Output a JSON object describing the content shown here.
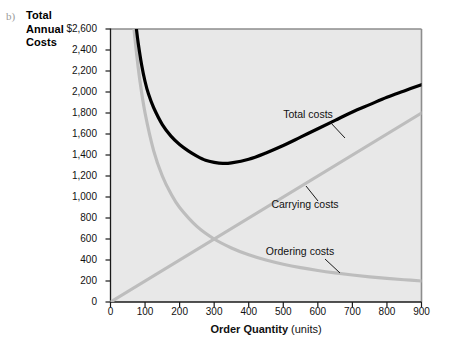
{
  "figure": {
    "part_label": "b)",
    "y_axis_title_lines": [
      "Total",
      "Annual",
      "Costs"
    ],
    "x_axis_title_strong": "Order Quantity",
    "x_axis_title_rest": " (units)"
  },
  "chart_data": {
    "type": "line",
    "title": "",
    "xlabel": "Order Quantity (units)",
    "ylabel": "Total Annual Costs",
    "xlim": [
      0,
      900
    ],
    "ylim": [
      0,
      2600
    ],
    "xticks": [
      0,
      100,
      200,
      300,
      400,
      500,
      600,
      700,
      800,
      900
    ],
    "xtick_labels": [
      "0",
      "100",
      "200",
      "300",
      "400",
      "500",
      "600",
      "700",
      "800",
      "900"
    ],
    "yticks": [
      0,
      200,
      400,
      600,
      800,
      1000,
      1200,
      1400,
      1600,
      1800,
      2000,
      2200,
      2400,
      2600
    ],
    "ytick_labels": [
      "0",
      "200",
      "400",
      "600",
      "800",
      "1,000",
      "1,200",
      "1,400",
      "1,600",
      "1,800",
      "2,000",
      "2,200",
      "2,400",
      "$2,600"
    ],
    "grid": false,
    "legend_position": "inline-annotations",
    "plot_background": "#e8e8e8",
    "series": [
      {
        "name": "Total costs",
        "color": "#000000",
        "width": 3.2,
        "annotation": "Total costs",
        "x": [
          75,
          80,
          90,
          100,
          110,
          125,
          150,
          175,
          200,
          225,
          250,
          275,
          300,
          325,
          350,
          400,
          450,
          500,
          550,
          600,
          650,
          700,
          750,
          800,
          850,
          900
        ],
        "y": [
          2600,
          2470,
          2260,
          2100,
          1980,
          1850,
          1690,
          1580,
          1500,
          1440,
          1390,
          1350,
          1330,
          1320,
          1325,
          1360,
          1420,
          1490,
          1570,
          1650,
          1730,
          1810,
          1880,
          1950,
          2010,
          2070
        ]
      },
      {
        "name": "Carrying costs",
        "color": "#bdbdbd",
        "width": 3.2,
        "annotation": "Carrying costs",
        "x": [
          0,
          900
        ],
        "y": [
          0,
          1800
        ]
      },
      {
        "name": "Ordering costs",
        "color": "#bdbdbd",
        "width": 3.2,
        "annotation": "Ordering costs",
        "x": [
          68,
          75,
          85,
          100,
          125,
          150,
          175,
          200,
          250,
          300,
          350,
          400,
          450,
          500,
          550,
          600,
          650,
          700,
          750,
          800,
          850,
          900
        ],
        "y": [
          2600,
          2380,
          2110,
          1800,
          1440,
          1200,
          1030,
          900,
          720,
          600,
          515,
          450,
          400,
          360,
          327,
          300,
          277,
          257,
          240,
          225,
          212,
          200
        ]
      }
    ],
    "annotations": [
      {
        "text": "Total costs",
        "x_px": 308,
        "y_px": 114
      },
      {
        "text": "Carrying costs",
        "x_px": 305,
        "y_px": 204
      },
      {
        "text": "Ordering costs",
        "x_px": 300,
        "y_px": 251
      }
    ]
  }
}
